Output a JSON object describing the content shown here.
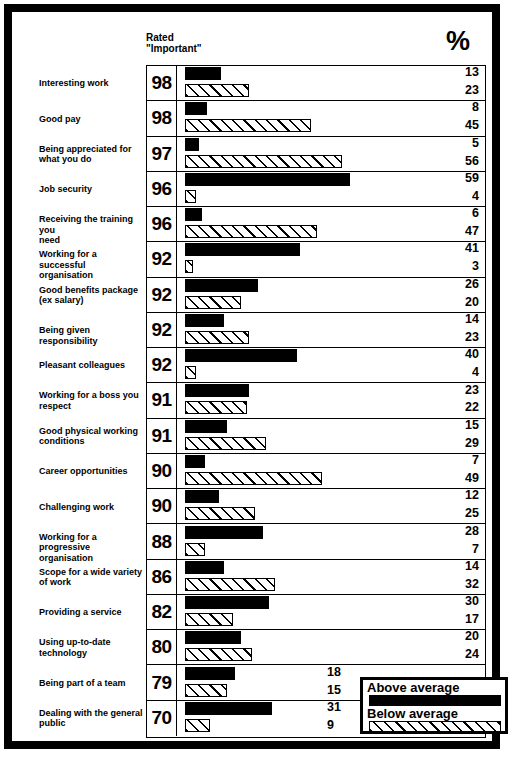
{
  "header": {
    "rated_label_line1": "Rated",
    "rated_label_line2": "\"Important\"",
    "percent_sign": "%"
  },
  "legend": {
    "above_label": "Above average",
    "below_label": "Below average"
  },
  "chart_data": {
    "type": "bar",
    "title": "",
    "xlabel": "",
    "ylabel": "",
    "grid": false,
    "orientation": "horizontal",
    "legend_position": "bottom-right",
    "xlim": [
      0,
      60
    ],
    "categories": [
      "Interesting work",
      "Good pay",
      "Being appreciated for what you do",
      "Job security",
      "Receiving the training you need",
      "Working for a successful organisation",
      "Good benefits package (ex salary)",
      "Being given responsibility",
      "Pleasant colleagues",
      "Working for a boss you respect",
      "Good physical working conditions",
      "Career opportunities",
      "Challenging work",
      "Working for a progressive organisation",
      "Scope for a wide variety of work",
      "Providing a service",
      "Using up-to-date technology",
      "Being part of a team",
      "Dealing with the general public"
    ],
    "rated_important": [
      98,
      98,
      97,
      96,
      96,
      92,
      92,
      92,
      92,
      91,
      91,
      90,
      90,
      88,
      86,
      82,
      80,
      79,
      70
    ],
    "series": [
      {
        "name": "Above average",
        "values": [
          13,
          8,
          5,
          59,
          6,
          41,
          26,
          14,
          40,
          23,
          15,
          7,
          12,
          28,
          14,
          30,
          20,
          18,
          31
        ]
      },
      {
        "name": "Below average",
        "values": [
          23,
          45,
          56,
          4,
          47,
          3,
          20,
          23,
          4,
          22,
          29,
          49,
          25,
          7,
          32,
          17,
          24,
          15,
          9
        ]
      }
    ]
  },
  "rows": [
    {
      "label_lines": [
        "Interesting work"
      ],
      "rating": "98",
      "above": 13,
      "below": 23,
      "above_text": "13",
      "below_text": "23",
      "inline": false
    },
    {
      "label_lines": [
        "Good pay"
      ],
      "rating": "98",
      "above": 8,
      "below": 45,
      "above_text": "8",
      "below_text": "45",
      "inline": false
    },
    {
      "label_lines": [
        "Being appreciated for",
        "what you do"
      ],
      "rating": "97",
      "above": 5,
      "below": 56,
      "above_text": "5",
      "below_text": "56",
      "inline": false
    },
    {
      "label_lines": [
        "Job security"
      ],
      "rating": "96",
      "above": 59,
      "below": 4,
      "above_text": "59",
      "below_text": "4",
      "inline": false
    },
    {
      "label_lines": [
        "Receiving the training you",
        "need"
      ],
      "rating": "96",
      "above": 6,
      "below": 47,
      "above_text": "6",
      "below_text": "47",
      "inline": false
    },
    {
      "label_lines": [
        "Working for a successful",
        "organisation"
      ],
      "rating": "92",
      "above": 41,
      "below": 3,
      "above_text": "41",
      "below_text": "3",
      "inline": false
    },
    {
      "label_lines": [
        "Good benefits package",
        "(ex salary)"
      ],
      "rating": "92",
      "above": 26,
      "below": 20,
      "above_text": "26",
      "below_text": "20",
      "inline": false
    },
    {
      "label_lines": [
        "Being given responsibility"
      ],
      "rating": "92",
      "above": 14,
      "below": 23,
      "above_text": "14",
      "below_text": "23",
      "inline": false
    },
    {
      "label_lines": [
        "Pleasant colleagues"
      ],
      "rating": "92",
      "above": 40,
      "below": 4,
      "above_text": "40",
      "below_text": "4",
      "inline": false
    },
    {
      "label_lines": [
        "Working for a boss you",
        "respect"
      ],
      "rating": "91",
      "above": 23,
      "below": 22,
      "above_text": "23",
      "below_text": "22",
      "inline": false
    },
    {
      "label_lines": [
        "Good physical working",
        "conditions"
      ],
      "rating": "91",
      "above": 15,
      "below": 29,
      "above_text": "15",
      "below_text": "29",
      "inline": false
    },
    {
      "label_lines": [
        "Career opportunities"
      ],
      "rating": "90",
      "above": 7,
      "below": 49,
      "above_text": "7",
      "below_text": "49",
      "inline": false
    },
    {
      "label_lines": [
        "Challenging work"
      ],
      "rating": "90",
      "above": 12,
      "below": 25,
      "above_text": "12",
      "below_text": "25",
      "inline": false
    },
    {
      "label_lines": [
        "Working for a progressive",
        "organisation"
      ],
      "rating": "88",
      "above": 28,
      "below": 7,
      "above_text": "28",
      "below_text": "7",
      "inline": false
    },
    {
      "label_lines": [
        "Scope for a wide variety",
        "of work"
      ],
      "rating": "86",
      "above": 14,
      "below": 32,
      "above_text": "14",
      "below_text": "32",
      "inline": false
    },
    {
      "label_lines": [
        "Providing a service"
      ],
      "rating": "82",
      "above": 30,
      "below": 17,
      "above_text": "30",
      "below_text": "17",
      "inline": false
    },
    {
      "label_lines": [
        "Using up-to-date",
        "technology"
      ],
      "rating": "80",
      "above": 20,
      "below": 24,
      "above_text": "20",
      "below_text": "24",
      "inline": false
    },
    {
      "label_lines": [
        "Being part of a team"
      ],
      "rating": "79",
      "above": 18,
      "below": 15,
      "above_text": "18",
      "below_text": "15",
      "inline": true
    },
    {
      "label_lines": [
        "Dealing with the general",
        "public"
      ],
      "rating": "70",
      "above": 31,
      "below": 9,
      "above_text": "31",
      "below_text": "9",
      "inline": true
    }
  ]
}
